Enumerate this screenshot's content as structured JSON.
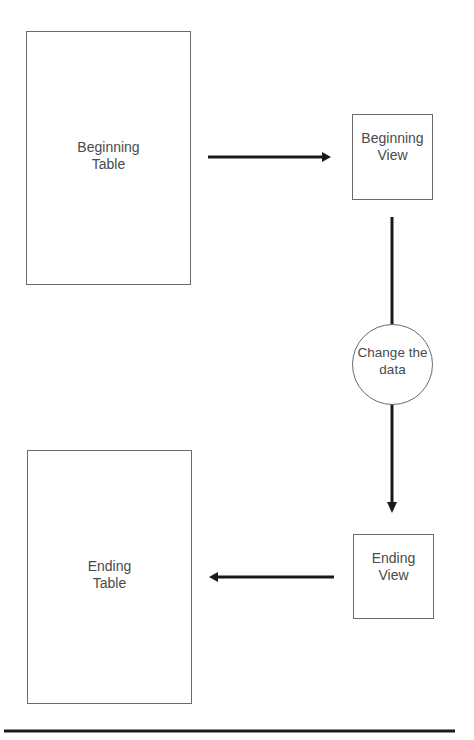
{
  "diagram": {
    "nodes": {
      "beginning_table": {
        "label": "Beginning\nTable",
        "shape": "rectangle"
      },
      "beginning_view": {
        "label": "Beginning\nView",
        "shape": "rectangle"
      },
      "change_data": {
        "label": "Change the\ndata",
        "shape": "circle"
      },
      "ending_view": {
        "label": "Ending\nView",
        "shape": "rectangle"
      },
      "ending_table": {
        "label": "Ending\nTable",
        "shape": "rectangle"
      }
    },
    "edges": [
      {
        "from": "beginning_table",
        "to": "beginning_view",
        "direction": "right"
      },
      {
        "from": "beginning_view",
        "to": "change_data",
        "direction": "down",
        "arrowhead": false
      },
      {
        "from": "change_data",
        "to": "ending_view",
        "direction": "down"
      },
      {
        "from": "ending_view",
        "to": "ending_table",
        "direction": "left"
      }
    ],
    "colors": {
      "stroke": "#6a6a6a",
      "arrow": "#1a1a1a",
      "text": "#4a4a4a",
      "background": "#ffffff"
    }
  }
}
